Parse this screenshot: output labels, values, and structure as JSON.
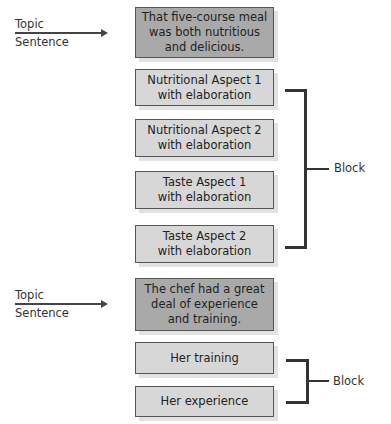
{
  "diagram": {
    "sections": [
      {
        "topic_label": [
          "Topic",
          "Sentence"
        ],
        "topic_box": "That five-course meal was both nutritious and delicious.",
        "topic_lines": [
          "That five-course meal",
          "was both nutritious",
          "and delicious."
        ],
        "support_boxes": [
          {
            "lines": [
              "Nutritional Aspect 1",
              "with elaboration"
            ]
          },
          {
            "lines": [
              "Nutritional Aspect 2",
              "with elaboration"
            ]
          },
          {
            "lines": [
              "Taste Aspect 1",
              "with elaboration"
            ]
          },
          {
            "lines": [
              "Taste Aspect 2",
              "with elaboration"
            ]
          }
        ],
        "bracket_label": "Block"
      },
      {
        "topic_label": [
          "Topic",
          "Sentence"
        ],
        "topic_box": "The chef had a great deal of experience and training.",
        "topic_lines": [
          "The chef had a great",
          "deal of experience",
          "and training."
        ],
        "support_boxes": [
          {
            "lines": [
              "Her training"
            ]
          },
          {
            "lines": [
              "Her experience"
            ]
          }
        ],
        "bracket_label": "Block"
      }
    ],
    "colors": {
      "topic_box_fill": "#a9a9a9",
      "support_box_fill": "#d7d7d7",
      "border": "#555555",
      "bracket": "#333333"
    }
  }
}
